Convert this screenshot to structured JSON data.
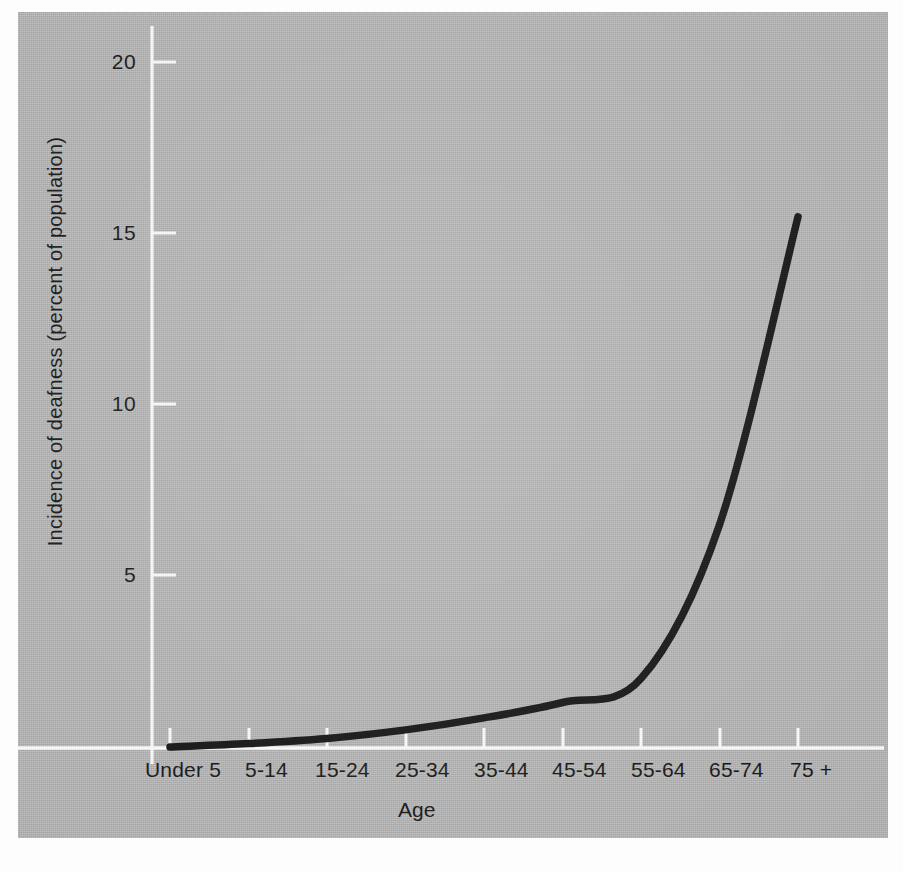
{
  "figure": {
    "background_color": "#b6b6b6",
    "axis_color": "#f2f2f2",
    "curve_color": "#1a1a1a",
    "text_color": "#1b1b1b"
  },
  "chart_data": {
    "type": "line",
    "title": "",
    "xlabel": "Age",
    "ylabel": "Incidence of deafness (percent of population)",
    "categories": [
      "Under 5",
      "5-14",
      "15-24",
      "25-34",
      "35-44",
      "45-54",
      "55-64",
      "65-74",
      "75 +"
    ],
    "x_tick_labels": [
      "Under 5",
      "5-14",
      "15-24",
      "25-34",
      "35-44",
      "45-54",
      "55-64",
      "65-74",
      "75 +"
    ],
    "y_tick_labels": [
      "5",
      "10",
      "15",
      "20"
    ],
    "y_ticks": [
      5,
      10,
      15,
      20
    ],
    "ylim": [
      0,
      21.3
    ],
    "xlim": [
      0,
      8
    ],
    "grid": false,
    "legend": false,
    "series": [
      {
        "name": "Incidence of deafness",
        "values": [
          0.0,
          0.1,
          0.25,
          0.5,
          0.85,
          1.3,
          2.0,
          6.5,
          15.5
        ]
      }
    ]
  },
  "axes": {
    "y_title": "Incidence of deafness (percent of population)",
    "x_title": "Age",
    "y_ticks": [
      {
        "label": "20",
        "value": 20
      },
      {
        "label": "15",
        "value": 15
      },
      {
        "label": "10",
        "value": 10
      },
      {
        "label": "5",
        "value": 5
      }
    ],
    "x_ticks": [
      {
        "label": "Under 5"
      },
      {
        "label": "5-14"
      },
      {
        "label": "15-24"
      },
      {
        "label": "25-34"
      },
      {
        "label": "35-44"
      },
      {
        "label": "45-54"
      },
      {
        "label": "55-64"
      },
      {
        "label": "65-74"
      },
      {
        "label": "75 +"
      }
    ]
  }
}
